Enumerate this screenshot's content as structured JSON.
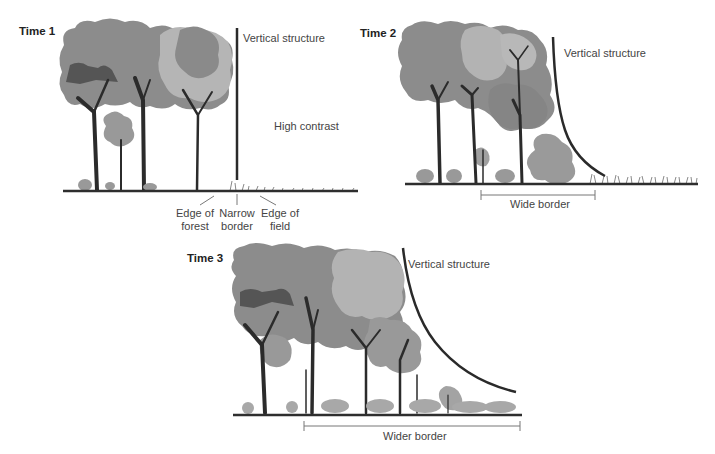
{
  "panels": [
    {
      "id": "time1",
      "title": "Time 1",
      "vertical_label": "Vertical structure",
      "contrast_label": "High contrast",
      "edge_labels": [
        {
          "line1": "Edge of",
          "line2": "forest"
        },
        {
          "line1": "Narrow",
          "line2": "border"
        },
        {
          "line1": "Edge of",
          "line2": "field"
        }
      ]
    },
    {
      "id": "time2",
      "title": "Time 2",
      "vertical_label": "Vertical structure",
      "border_label": "Wide border"
    },
    {
      "id": "time3",
      "title": "Time 3",
      "vertical_label": "Vertical structure",
      "border_label": "Wider border"
    }
  ],
  "colors": {
    "canopy_dark": "#7a7a7a",
    "canopy_mid": "#8e8e8e",
    "canopy_light": "#b3b3b3",
    "trunk": "#2b2b2b",
    "ground": "#2e2e2e",
    "structure_line": "#2a2a2a",
    "border_bar": "#777777"
  }
}
